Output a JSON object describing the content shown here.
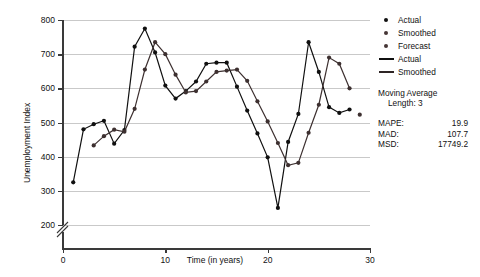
{
  "chart_data": {
    "type": "line",
    "title": "",
    "xlabel": "Time (in years)",
    "ylabel": "Unemployment Index",
    "xlim": [
      0,
      30
    ],
    "ylim": [
      200,
      800
    ],
    "y_axis_broken": true,
    "grid": true,
    "xticks": [
      "0",
      "10",
      "20",
      "30"
    ],
    "xtick_values": [
      0,
      10,
      20,
      30
    ],
    "yticks": [
      "200",
      "300",
      "400",
      "500",
      "600",
      "700",
      "800"
    ],
    "ytick_values": [
      200,
      300,
      400,
      500,
      600,
      700,
      800
    ],
    "legend_position": "right",
    "x": [
      1,
      2,
      3,
      4,
      5,
      6,
      7,
      8,
      9,
      10,
      11,
      12,
      13,
      14,
      15,
      16,
      17,
      18,
      19,
      20,
      21,
      22,
      23,
      24,
      25,
      26,
      27,
      28
    ],
    "series": [
      {
        "name": "Actual",
        "color": "#101010",
        "marker": "circle",
        "values": [
          325,
          480,
          495,
          505,
          438,
          478,
          722,
          775,
          705,
          608,
          570,
          592,
          620,
          672,
          675,
          675,
          605,
          535,
          468,
          398,
          250,
          443,
          525,
          735,
          648,
          545,
          528,
          538
        ]
      },
      {
        "name": "Smoothed",
        "color": "#3d3030",
        "marker": "circle",
        "values": [
          null,
          null,
          433,
          460,
          479,
          473,
          540,
          655,
          735,
          700,
          640,
          588,
          592,
          620,
          648,
          652,
          655,
          622,
          562,
          503,
          440,
          375,
          382,
          470,
          552,
          690,
          672,
          600
        ]
      },
      {
        "name": "Forecast",
        "color": "#3d3030",
        "marker": "circle",
        "x": [
          29
        ],
        "values": [
          523
        ]
      }
    ],
    "annotations": {
      "method_title": "Moving Average",
      "method_sub": "Length: 3",
      "accuracy": [
        {
          "label": "MAPE:",
          "value": "19.9"
        },
        {
          "label": "MAD:",
          "value": "107.7"
        },
        {
          "label": "MSD:",
          "value": "17749.2"
        }
      ]
    }
  },
  "legend": {
    "items": [
      {
        "label": "Actual",
        "type": "marker",
        "color": "#101010"
      },
      {
        "label": "Smoothed",
        "type": "marker",
        "color": "#463636"
      },
      {
        "label": "Forecast",
        "type": "marker",
        "color": "#463636"
      },
      {
        "label": "Actual",
        "type": "line",
        "color": "#101010"
      },
      {
        "label": "Smoothed",
        "type": "line",
        "color": "#2e2525"
      }
    ]
  }
}
